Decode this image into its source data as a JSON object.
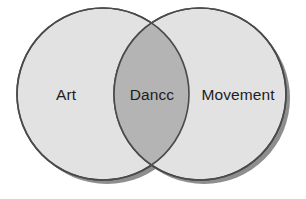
{
  "diagram": {
    "type": "venn",
    "title": "",
    "background_color": "#ffffff",
    "sets": [
      {
        "id": "left",
        "label": "Art",
        "fill_color": "#e2e2e2",
        "stroke_color": "#4a4a4a",
        "cx": 103,
        "cy": 94,
        "r": 86
      },
      {
        "id": "right",
        "label": "Movement",
        "fill_color": "#e2e2e2",
        "stroke_color": "#4a4a4a",
        "cx": 200,
        "cy": 94,
        "r": 86
      }
    ],
    "intersection": {
      "label": "Dancc",
      "fill_color": "#b4b4b4",
      "cx": 152,
      "cy": 94
    },
    "shadow": {
      "color": "#8e8e8e",
      "offset_x": 4,
      "offset_y": 4
    },
    "labels": {
      "left_label": "Art",
      "center_label": "Dancc",
      "right_label": "Movement",
      "text_color": "#1d1d1d"
    }
  }
}
